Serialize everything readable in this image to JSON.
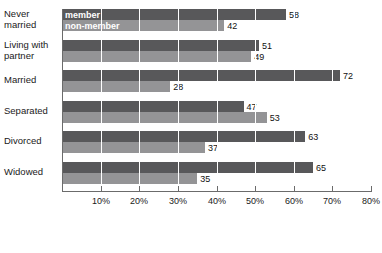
{
  "chart_data": {
    "type": "bar",
    "orientation": "horizontal",
    "title": "",
    "xlabel": "",
    "ylabel": "",
    "xlim": [
      0,
      80
    ],
    "grid": true,
    "legend_position": "overlay-first-group",
    "categories": [
      "Never\nmarried",
      "Living with\npartner",
      "Married",
      "Separated",
      "Divorced",
      "Widowed"
    ],
    "series": [
      {
        "name": "member",
        "values": [
          58,
          51,
          72,
          47,
          63,
          65
        ],
        "color": "#58585a"
      },
      {
        "name": "non-member",
        "values": [
          42,
          49,
          28,
          53,
          37,
          35
        ],
        "color": "#949496"
      }
    ],
    "tick_labels": [
      "10%",
      "20%",
      "30%",
      "40%",
      "50%",
      "60%",
      "70%",
      "80%"
    ],
    "tick_values": [
      10,
      20,
      30,
      40,
      50,
      60,
      70,
      80
    ],
    "data_labels": {
      "member": [
        "58",
        "51",
        "72",
        "47",
        "63",
        "65"
      ],
      "non_member": [
        "42",
        "49",
        "28",
        "53",
        "37",
        "35"
      ]
    }
  },
  "legend": {
    "member_label": "member",
    "nonmember_label": "non-member"
  },
  "colors": {
    "member": "#58585a",
    "non_member": "#949496",
    "axis": "#6b6b6b",
    "gridline": "#ffffff",
    "text": "#1a1a1a"
  }
}
